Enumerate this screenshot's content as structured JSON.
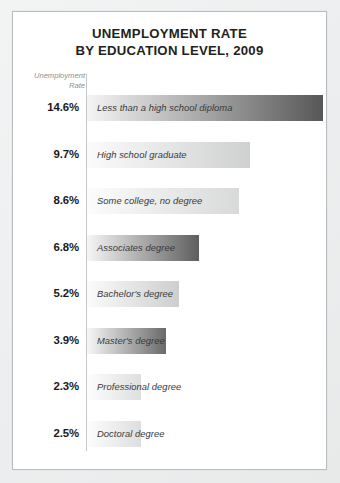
{
  "card": {
    "title_line1": "UNEMPLOYMENT RATE",
    "title_line2": "BY EDUCATION LEVEL, 2009"
  },
  "axis": {
    "caption_line1": "Unemployment",
    "caption_line2": "Rate"
  },
  "colors": {
    "background": "#eceded",
    "card": "#ffffff",
    "border": "#b9bcbe",
    "title_text": "#231f20",
    "caption_text": "#8c8f92",
    "bar_label_text": "#3a3a3c",
    "value_text": "#1a1a1a",
    "axis_line": "#c4c7c9"
  },
  "chart_data": {
    "type": "bar",
    "orientation": "horizontal",
    "title": "UNEMPLOYMENT RATE BY EDUCATION LEVEL, 2009",
    "subtitle": "",
    "xlabel": "",
    "ylabel": "Unemployment Rate",
    "xlim": [
      0,
      16
    ],
    "grid": false,
    "legend": false,
    "categories": [
      "Less than a high school diploma",
      "High school graduate",
      "Some college, no degree",
      "Associates degree",
      "Bachelor's degree",
      "Master's degree",
      "Professional degree",
      "Doctoral degree"
    ],
    "values": [
      14.6,
      9.7,
      8.6,
      6.8,
      5.2,
      3.9,
      2.3,
      2.5
    ],
    "value_labels": [
      "14.6%",
      "9.7%",
      "8.6%",
      "6.8%",
      "5.2%",
      "3.9%",
      "2.3%",
      "2.5%"
    ],
    "bars": [
      {
        "label": "Less than a high school diploma",
        "value": 14.6,
        "value_label": "14.6%",
        "bar_width_px": 236,
        "gradient_from": "#f4f4f4",
        "gradient_to": "#575757"
      },
      {
        "label": "High school graduate",
        "value": 9.7,
        "value_label": "9.7%",
        "bar_width_px": 163,
        "gradient_from": "#fbfbfb",
        "gradient_to": "#cfd0d0"
      },
      {
        "label": "Some college, no degree",
        "value": 8.6,
        "value_label": "8.6%",
        "bar_width_px": 152,
        "gradient_from": "#fcfcfc",
        "gradient_to": "#d8d9d9"
      },
      {
        "label": "Associates degree",
        "value": 6.8,
        "value_label": "6.8%",
        "bar_width_px": 112,
        "gradient_from": "#f6f6f6",
        "gradient_to": "#5e5e5e"
      },
      {
        "label": "Bachelor's degree",
        "value": 5.2,
        "value_label": "5.2%",
        "bar_width_px": 92,
        "gradient_from": "#fbfbfb",
        "gradient_to": "#cdcecf"
      },
      {
        "label": "Master's degree",
        "value": 3.9,
        "value_label": "3.9%",
        "bar_width_px": 79,
        "gradient_from": "#f7f7f7",
        "gradient_to": "#6a6a6a"
      },
      {
        "label": "Professional degree",
        "value": 2.3,
        "value_label": "2.3%",
        "bar_width_px": 54,
        "gradient_from": "#fdfdfd",
        "gradient_to": "#dedfdf"
      },
      {
        "label": "Doctoral degree",
        "value": 2.5,
        "value_label": "2.5%",
        "bar_width_px": 54,
        "gradient_from": "#fdfdfd",
        "gradient_to": "#dddede"
      }
    ]
  }
}
